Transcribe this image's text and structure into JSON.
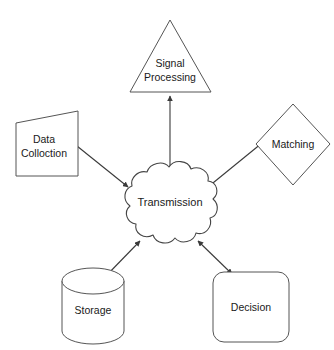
{
  "diagram": {
    "type": "block-diagram",
    "background_color": "#ffffff",
    "stroke_color": "#555555",
    "text_color": "#1a1a1a",
    "center": {
      "id": "transmission",
      "label": "Transmission",
      "shape": "cloud"
    },
    "nodes": [
      {
        "id": "signal-processing",
        "label_line1": "Signal",
        "label_line2": "Processing",
        "shape": "triangle",
        "position": "top"
      },
      {
        "id": "data-colloction",
        "label_line1": "Data",
        "label_line2": "Colloction",
        "shape": "slanted-quadrilateral",
        "position": "left"
      },
      {
        "id": "matching",
        "label_line1": "Matching",
        "label_line2": "",
        "shape": "diamond",
        "position": "right"
      },
      {
        "id": "storage",
        "label_line1": "Storage",
        "label_line2": "",
        "shape": "cylinder",
        "position": "bottom-left"
      },
      {
        "id": "decision",
        "label_line1": "Decision",
        "label_line2": "",
        "shape": "rounded-rectangle",
        "position": "bottom-right"
      }
    ],
    "connectors": [
      {
        "id": "link-transmission-signal-processing",
        "from": "transmission",
        "to": "signal-processing",
        "direction": "bidirectional"
      },
      {
        "id": "link-transmission-data-colloction",
        "from": "transmission",
        "to": "data-colloction",
        "direction": "bidirectional"
      },
      {
        "id": "link-transmission-matching",
        "from": "transmission",
        "to": "matching",
        "direction": "bidirectional"
      },
      {
        "id": "link-transmission-storage",
        "from": "transmission",
        "to": "storage",
        "direction": "bidirectional"
      },
      {
        "id": "link-transmission-decision",
        "from": "transmission",
        "to": "decision",
        "direction": "bidirectional"
      }
    ]
  }
}
